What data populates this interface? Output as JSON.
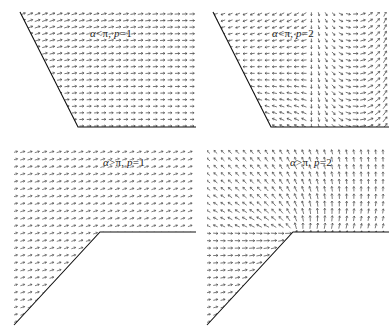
{
  "figure": {
    "background_color": "#ffffff",
    "arrow_color": "#3a3a3a",
    "boundary_color": "#111111",
    "layout": "2x2 grid of quiver plots"
  },
  "panels": [
    {
      "id": "top-left",
      "label": "α < π, p = 1",
      "label_parts": {
        "alpha": "α",
        "relation": "<",
        "pi": "π",
        "p": "p",
        "equals": "=",
        "p_value": "1"
      },
      "domain": "convex wedge (alpha less than pi)",
      "p": 1,
      "alpha_relation": "lt",
      "field_description": "smooth near-uniform field bending from upper-left diagonal toward horizontal at the bottom"
    },
    {
      "id": "top-right",
      "label": "α < π, p = 2",
      "label_parts": {
        "alpha": "α",
        "relation": "<",
        "pi": "π",
        "p": "p",
        "equals": "=",
        "p_value": "2"
      },
      "domain": "convex wedge (alpha less than pi)",
      "p": 2,
      "alpha_relation": "lt",
      "field_description": "field with an interior stagnation/turning line; arrows curve left on the upper band and sweep down-right on the right side"
    },
    {
      "id": "bottom-left",
      "label": "α > π, p = 1",
      "label_parts": {
        "alpha": "α",
        "relation": ">",
        "pi": "π",
        "p": "p",
        "equals": "=",
        "p_value": "1"
      },
      "domain": "reentrant corner (alpha greater than pi)",
      "p": 1,
      "alpha_relation": "gt",
      "field_description": "nearly uniform field tilted slightly up-right over the whole reentrant region"
    },
    {
      "id": "bottom-right",
      "label": "α > π, p = 2",
      "label_parts": {
        "alpha": "α",
        "relation": ">",
        "pi": "π",
        "p": "p",
        "equals": "=",
        "p_value": "2"
      },
      "domain": "reentrant corner (alpha greater than pi)",
      "p": 2,
      "alpha_relation": "gt",
      "field_description": "field rotating around the reentrant vertex: vertical on the left, diagonal on the upper right, with a singular concentration at the corner"
    }
  ],
  "chart_data": {
    "type": "scatter",
    "xlabel": "",
    "ylabel": "",
    "legend_position": "none",
    "grid": false,
    "subplots": [
      {
        "name": "alpha < pi, p = 1",
        "geometry": {
          "type": "convex-wedge",
          "vertices": [
            [
              20,
              12
            ],
            [
              78,
              127
            ],
            [
              196,
              127
            ],
            [
              196,
              12
            ]
          ],
          "edges": [
            "slanted left edge from (20,12) to (78,127)",
            "horizontal bottom edge from (78,127) to (196,127)"
          ]
        },
        "field": {
          "model": "gradient of wedge eigenfunction, p=1, convex",
          "angle_deg_at_top_left": 20,
          "angle_deg_at_bottom_right": 0,
          "magnitude_range": [
            0.35,
            1.0
          ],
          "sample_grid": [
            26,
            18
          ]
        }
      },
      {
        "name": "alpha < pi, p = 2",
        "geometry": {
          "type": "convex-wedge",
          "vertices": [
            [
              213,
              12
            ],
            [
              271,
              127
            ],
            [
              389,
              127
            ],
            [
              389,
              12
            ]
          ],
          "edges": [
            "slanted left edge from (213,12) to (271,127)",
            "horizontal bottom edge from (271,127) to (389,127)"
          ]
        },
        "field": {
          "model": "gradient of wedge eigenfunction, p=2, convex",
          "interior_feature": "vertical separating line at about x = 0.58 of panel width",
          "magnitude_range": [
            0.15,
            1.0
          ],
          "sample_grid": [
            26,
            18
          ]
        }
      },
      {
        "name": "alpha > pi, p = 1",
        "geometry": {
          "type": "reentrant-corner",
          "vertices": [
            [
              14,
              148
            ],
            [
              196,
              148
            ],
            [
              196,
              232
            ],
            [
              100,
              232
            ],
            [
              14,
              325
            ]
          ],
          "edges": [
            "horizontal edge from (100,232) to (196,232)",
            "diagonal edge from (100,232) down-left to (14,325)"
          ],
          "corner_vertex": [
            100,
            232
          ]
        },
        "field": {
          "model": "gradient of wedge eigenfunction, p=1, reentrant",
          "angle_deg": 18,
          "magnitude_range": [
            0.5,
            1.0
          ],
          "sample_grid": [
            26,
            24
          ]
        }
      },
      {
        "name": "alpha > pi, p = 2",
        "geometry": {
          "type": "reentrant-corner",
          "vertices": [
            [
              207,
              148
            ],
            [
              389,
              148
            ],
            [
              389,
              232
            ],
            [
              293,
              232
            ],
            [
              207,
              325
            ]
          ],
          "edges": [
            "horizontal edge from (293,232) to (389,232)",
            "diagonal edge from (293,232) down-left to (207,325)"
          ],
          "corner_vertex": [
            293,
            232
          ]
        },
        "field": {
          "model": "gradient of wedge eigenfunction, p=2, reentrant, singular at corner",
          "angle_deg_left": 90,
          "angle_deg_upper_right": 35,
          "magnitude_range": [
            0.2,
            1.4
          ],
          "sample_grid": [
            26,
            24
          ]
        }
      }
    ]
  }
}
